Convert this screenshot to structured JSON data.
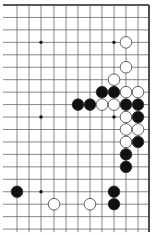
{
  "diagram": {
    "type": "go-board-fragment",
    "grid": {
      "cols": 13,
      "rows": 19,
      "x0": 5,
      "y0": 5,
      "dx": 12.0,
      "dy": 12.45,
      "edges": [
        "top",
        "right"
      ]
    },
    "star_points": [
      [
        3,
        3
      ],
      [
        9,
        3
      ],
      [
        3,
        9
      ],
      [
        9,
        9
      ],
      [
        3,
        15
      ]
    ],
    "stones": [
      {
        "c": 10,
        "r": 3,
        "color": "white"
      },
      {
        "c": 10,
        "r": 5,
        "color": "white"
      },
      {
        "c": 9,
        "r": 6,
        "color": "white"
      },
      {
        "c": 8,
        "r": 7,
        "color": "black"
      },
      {
        "c": 9,
        "r": 7,
        "color": "black"
      },
      {
        "c": 10,
        "r": 7,
        "color": "white"
      },
      {
        "c": 11,
        "r": 7,
        "color": "white"
      },
      {
        "c": 6,
        "r": 8,
        "color": "black"
      },
      {
        "c": 7,
        "r": 8,
        "color": "black"
      },
      {
        "c": 8,
        "r": 8,
        "color": "white"
      },
      {
        "c": 9,
        "r": 8,
        "color": "white"
      },
      {
        "c": 10,
        "r": 8,
        "color": "black"
      },
      {
        "c": 11,
        "r": 8,
        "color": "black"
      },
      {
        "c": 10,
        "r": 9,
        "color": "white"
      },
      {
        "c": 11,
        "r": 9,
        "color": "black"
      },
      {
        "c": 10,
        "r": 10,
        "color": "white"
      },
      {
        "c": 11,
        "r": 10,
        "color": "white"
      },
      {
        "c": 10,
        "r": 11,
        "color": "white"
      },
      {
        "c": 11,
        "r": 11,
        "color": "black"
      },
      {
        "c": 10,
        "r": 12,
        "color": "black"
      },
      {
        "c": 10,
        "r": 13,
        "color": "black"
      },
      {
        "c": 1,
        "r": 15,
        "color": "black"
      },
      {
        "c": 9,
        "r": 15,
        "color": "black"
      },
      {
        "c": 4,
        "r": 16,
        "color": "white"
      },
      {
        "c": 7,
        "r": 16,
        "color": "white"
      },
      {
        "c": 9,
        "r": 16,
        "color": "black"
      }
    ],
    "colors": {
      "line": "#555555",
      "edge": "#222222",
      "black": "#111111",
      "white": "#ffffff"
    }
  }
}
